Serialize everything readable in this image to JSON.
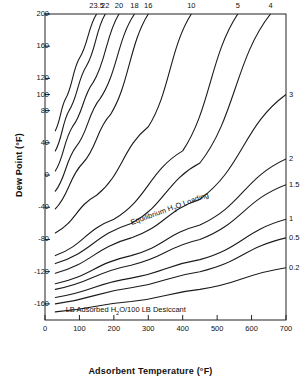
{
  "chart_data": {
    "type": "line",
    "title": "",
    "xlabel": "Adsorbent Temperature (°F)",
    "ylabel": "Dew Point (°F)",
    "xlim": [
      0,
      700
    ],
    "ylim": [
      -180,
      200
    ],
    "xticks": [
      0,
      100,
      200,
      300,
      400,
      500,
      600,
      700
    ],
    "yticks": [
      200,
      160,
      120,
      100,
      80,
      40,
      0,
      -40,
      -80,
      -120,
      -160
    ],
    "grid": false,
    "legend_position": "inline-curve-labels",
    "legend_title": "LB Adsorbed H2O/100 LB Desiccant",
    "annotations": [
      {
        "text": "Equilibrium H2O Loading",
        "x": 255,
        "y": -60,
        "rotation": -20
      },
      {
        "text": "LB Adsorbed H2O/100 LB Desiccant",
        "x": 60,
        "y": -168,
        "rotation": 0
      }
    ],
    "series": [
      {
        "name": "23.5",
        "label_pos": "top",
        "x": [
          30,
          60,
          100,
          150
        ],
        "y": [
          55,
          95,
          145,
          200
        ]
      },
      {
        "name": "22",
        "label_pos": "top",
        "x": [
          30,
          70,
          120,
          175
        ],
        "y": [
          30,
          80,
          135,
          200
        ]
      },
      {
        "name": "20",
        "label_pos": "top",
        "x": [
          30,
          80,
          140,
          215
        ],
        "y": [
          5,
          60,
          115,
          200
        ]
      },
      {
        "name": "18",
        "label_pos": "top",
        "x": [
          30,
          90,
          160,
          260
        ],
        "y": [
          -20,
          35,
          95,
          200
        ]
      },
      {
        "name": "16",
        "label_pos": "top",
        "x": [
          30,
          110,
          190,
          300
        ],
        "y": [
          -42,
          15,
          75,
          200
        ]
      },
      {
        "name": "10",
        "label_pos": "top",
        "x": [
          30,
          150,
          300,
          425
        ],
        "y": [
          -72,
          -25,
          60,
          200
        ]
      },
      {
        "name": "5",
        "label_pos": "top",
        "x": [
          30,
          200,
          400,
          560
        ],
        "y": [
          -100,
          -55,
          30,
          200
        ]
      },
      {
        "name": "4",
        "label_pos": "top",
        "x": [
          30,
          250,
          450,
          655
        ],
        "y": [
          -110,
          -60,
          15,
          200
        ]
      },
      {
        "name": "3",
        "label_pos": "right",
        "x": [
          30,
          250,
          450,
          700
        ],
        "y": [
          -122,
          -78,
          -30,
          100
        ]
      },
      {
        "name": "2",
        "label_pos": "right",
        "x": [
          30,
          250,
          450,
          700
        ],
        "y": [
          -135,
          -100,
          -62,
          20
        ]
      },
      {
        "name": "1.5",
        "label_pos": "right",
        "x": [
          30,
          250,
          450,
          700
        ],
        "y": [
          -142,
          -112,
          -80,
          -12
        ]
      },
      {
        "name": "1",
        "label_pos": "right",
        "x": [
          30,
          250,
          450,
          700
        ],
        "y": [
          -152,
          -128,
          -105,
          -55
        ]
      },
      {
        "name": "0.5",
        "label_pos": "right",
        "x": [
          30,
          250,
          450,
          700
        ],
        "y": [
          -160,
          -140,
          -120,
          -78
        ]
      },
      {
        "name": "0.2",
        "label_pos": "right",
        "x": [
          30,
          250,
          450,
          700
        ],
        "y": [
          -170,
          -157,
          -142,
          -115
        ]
      }
    ]
  },
  "axes": {
    "y_title": "Dew Point (°F)",
    "x_title": "Adsorbent Temperature (°F)",
    "y_tick_labels": [
      "200",
      "160",
      "120",
      "100",
      "80",
      "40",
      "0",
      "-40",
      "-80",
      "-120",
      "-160"
    ],
    "x_tick_labels": [
      "0",
      "100",
      "200",
      "300",
      "400",
      "500",
      "600",
      "700"
    ]
  },
  "curve_labels": {
    "top": [
      "23.5",
      "22",
      "20",
      "18",
      "16",
      "10",
      "5",
      "4"
    ],
    "right": [
      "3",
      "2",
      "1.5",
      "1",
      "0.5",
      "0.2"
    ]
  },
  "annotations": {
    "equilibrium": "Equilibrium H",
    "equilibrium_sub": "2",
    "equilibrium_tail": "O Loading",
    "units_head": "LB Adsorbed H",
    "units_sub": "2",
    "units_tail": "O/100 LB Desiccant"
  }
}
